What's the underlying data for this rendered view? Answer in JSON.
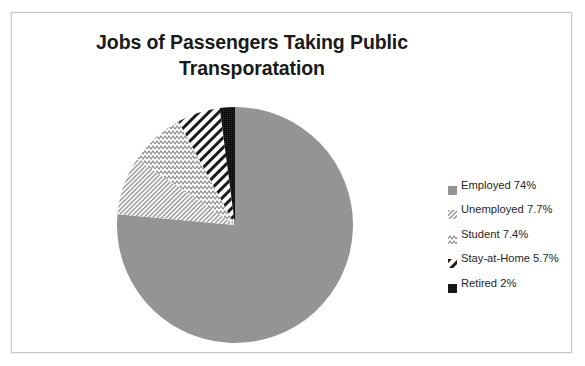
{
  "chart_data": {
    "type": "pie",
    "title": "Jobs of Passengers Taking Public Transporatation",
    "title_line1": "Jobs of Passengers Taking Public",
    "title_line2": "Transporatation",
    "categories": [
      "Employed",
      "Unemployed",
      "Student",
      "Stay-at-Home",
      "Retired"
    ],
    "values": [
      74,
      7.7,
      7.4,
      5.7,
      2
    ],
    "value_labels": [
      "74%",
      "7.7%",
      "7.4%",
      "5.7%",
      "2%"
    ],
    "legend_position": "right",
    "start_angle_deg": 0,
    "direction": "clockwise",
    "grid": false,
    "xlabel": "",
    "ylabel": "",
    "slices": [
      {
        "name": "Employed",
        "value": 74,
        "label": "Employed 74%",
        "pattern": "solid-gray",
        "fill": "#8c8c8c"
      },
      {
        "name": "Unemployed",
        "value": 7.7,
        "label": "Unemployed 7.7%",
        "pattern": "fine-diagonal",
        "fill": "#b4b4b4"
      },
      {
        "name": "Student",
        "value": 7.4,
        "label": "Student 7.4%",
        "pattern": "wavy-lines",
        "fill": "#a8a8a8"
      },
      {
        "name": "Stay-at-Home",
        "value": 5.7,
        "label": "Stay-at-Home 5.7%",
        "pattern": "diagonal-stripe",
        "fill": "#1a1a1a"
      },
      {
        "name": "Retired",
        "value": 2,
        "label": "Retired 2%",
        "pattern": "dense-dark",
        "fill": "#111111"
      }
    ]
  },
  "legend": {
    "items": [
      {
        "label": "Employed 74%",
        "icon": "legend-swatch-solid-gray-icon"
      },
      {
        "label": "Unemployed 7.7%",
        "icon": "legend-swatch-fine-diagonal-icon"
      },
      {
        "label": "Student 7.4%",
        "icon": "legend-swatch-wavy-icon"
      },
      {
        "label": "Stay-at-Home 5.7%",
        "icon": "legend-swatch-diagonal-stripe-icon"
      },
      {
        "label": "Retired 2%",
        "icon": "legend-swatch-dense-dark-icon"
      }
    ]
  },
  "colors": {
    "employed_gray": "#8c8c8c",
    "pattern_light": "#b4b4b4",
    "dark": "#1a1a1a",
    "text": "#262626",
    "frame": "#c9c9c9",
    "background": "#ffffff"
  }
}
